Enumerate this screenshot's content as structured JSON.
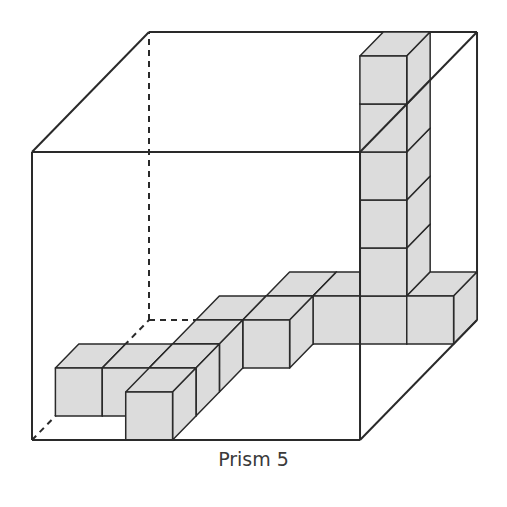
{
  "figure": {
    "caption": "Prism 5",
    "box_units": {
      "width": 7,
      "height": 6,
      "depth": 5
    },
    "cube_fill": "#dcdcdc",
    "line_color": "#2a2a2a",
    "cubes": [
      {
        "x": 5,
        "y": 5,
        "z": 4
      },
      {
        "x": 5,
        "y": 4,
        "z": 4
      },
      {
        "x": 5,
        "y": 3,
        "z": 4
      },
      {
        "x": 5,
        "y": 2,
        "z": 4
      },
      {
        "x": 5,
        "y": 1,
        "z": 4
      },
      {
        "x": 3,
        "y": 0,
        "z": 4
      },
      {
        "x": 4,
        "y": 0,
        "z": 4
      },
      {
        "x": 5,
        "y": 0,
        "z": 4
      },
      {
        "x": 6,
        "y": 0,
        "z": 4
      },
      {
        "x": 2,
        "y": 0,
        "z": 3
      },
      {
        "x": 3,
        "y": 0,
        "z": 3
      },
      {
        "x": 2,
        "y": 0,
        "z": 2
      },
      {
        "x": 0,
        "y": 0,
        "z": 1
      },
      {
        "x": 1,
        "y": 0,
        "z": 1
      },
      {
        "x": 2,
        "y": 0,
        "z": 1
      },
      {
        "x": 2,
        "y": 0,
        "z": 0
      }
    ]
  }
}
